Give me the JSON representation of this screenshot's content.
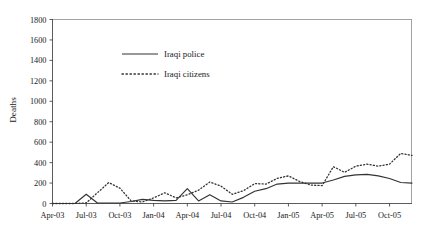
{
  "chart_data": {
    "type": "line",
    "title": "",
    "xlabel": "",
    "ylabel": "Deaths",
    "ylim": [
      0,
      1800
    ],
    "ytick_step": 200,
    "grid": false,
    "legend_position": "upper-center-left",
    "yticks": [
      "0",
      "200",
      "400",
      "600",
      "800",
      "1000",
      "1200",
      "1400",
      "1600",
      "1800"
    ],
    "xticks": [
      "Apr-03",
      "Jul-03",
      "Oct-03",
      "Jan-04",
      "Apr-04",
      "Jul-04",
      "Oct-04",
      "Jan-05",
      "Apr-05",
      "Jul-05",
      "Oct-05"
    ],
    "x": [
      "Apr-03",
      "May-03",
      "Jun-03",
      "Jul-03",
      "Aug-03",
      "Sep-03",
      "Oct-03",
      "Nov-03",
      "Dec-03",
      "Jan-04",
      "Feb-04",
      "Mar-04",
      "Apr-04",
      "May-04",
      "Jun-04",
      "Jul-04",
      "Aug-04",
      "Sep-04",
      "Oct-04",
      "Nov-04",
      "Dec-04",
      "Jan-05",
      "Feb-05",
      "Mar-05",
      "Apr-05",
      "May-05",
      "Jun-05",
      "Jul-05",
      "Aug-05",
      "Sep-05",
      "Oct-05",
      "Nov-05",
      "Dec-05"
    ],
    "series": [
      {
        "name": "Iraqi police",
        "style": "solid",
        "color": "#333333",
        "values": [
          0,
          0,
          0,
          90,
          5,
          5,
          5,
          20,
          40,
          30,
          25,
          30,
          145,
          25,
          85,
          25,
          15,
          60,
          120,
          145,
          190,
          200,
          200,
          200,
          200,
          230,
          265,
          280,
          285,
          270,
          245,
          205,
          200
        ]
      },
      {
        "name": "Iraqi citizens",
        "style": "dotted",
        "color": "#333333",
        "values": [
          0,
          0,
          0,
          5,
          105,
          205,
          150,
          25,
          15,
          55,
          105,
          55,
          85,
          130,
          210,
          170,
          90,
          125,
          195,
          190,
          245,
          270,
          215,
          180,
          175,
          360,
          305,
          365,
          385,
          365,
          385,
          490,
          470
        ]
      }
    ],
    "annotations": [
      {
        "label": "Iraqi citizens peak",
        "x": "Aug-05",
        "y": 1520
      }
    ]
  },
  "legend": {
    "entries": [
      {
        "label": "Iraqi police"
      },
      {
        "label": "Iraqi citizens"
      }
    ]
  }
}
